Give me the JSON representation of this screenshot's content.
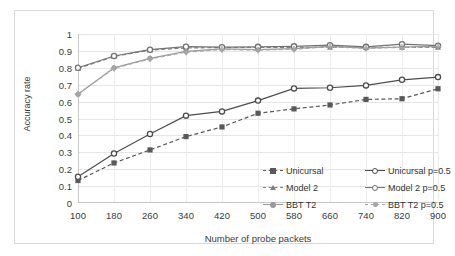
{
  "chart_data": {
    "type": "line",
    "title": "",
    "xlabel": "Number of probe packets",
    "ylabel": "Accuracy rate",
    "x": [
      100,
      180,
      260,
      340,
      420,
      500,
      580,
      660,
      740,
      820,
      900
    ],
    "xticklabels": [
      "100",
      "180",
      "260",
      "340",
      "420",
      "500",
      "580",
      "660",
      "740",
      "820",
      "900"
    ],
    "yticklabels": [
      "0",
      "0.1",
      "0.2",
      "0.3",
      "0.4",
      "0.5",
      "0.6",
      "0.7",
      "0.8",
      "0.9",
      "1"
    ],
    "ylim": [
      0,
      1
    ],
    "ytick_step": 0.1,
    "grid": true,
    "legend_position": "inside-lower-right",
    "series": [
      {
        "name": "Unicursal",
        "marker": "square",
        "dash": "dashed",
        "color": "#595959",
        "values": [
          0.133,
          0.237,
          0.314,
          0.393,
          0.45,
          0.531,
          0.557,
          0.58,
          0.613,
          0.617,
          0.676
        ]
      },
      {
        "name": "Model 2",
        "marker": "triangle",
        "dash": "dashed",
        "color": "#808080",
        "values": [
          0.796,
          0.867,
          0.905,
          0.917,
          0.92,
          0.92,
          0.921,
          0.921,
          0.92,
          0.921,
          0.921
        ]
      },
      {
        "name": "BBT T2",
        "marker": "circle",
        "dash": "solid",
        "color": "#999999",
        "values": [
          0.643,
          0.8,
          0.856,
          0.897,
          0.912,
          0.908,
          0.913,
          0.927,
          0.917,
          0.923,
          0.927
        ]
      },
      {
        "name": "Unicursal p=0.5",
        "marker": "circle-open",
        "dash": "solid",
        "color": "#4d4d4d",
        "values": [
          0.155,
          0.293,
          0.408,
          0.517,
          0.542,
          0.606,
          0.678,
          0.682,
          0.696,
          0.729,
          0.745
        ]
      },
      {
        "name": "Model 2 p=0.5",
        "marker": "circle-open",
        "dash": "solid",
        "color": "#737373",
        "values": [
          0.8,
          0.87,
          0.907,
          0.925,
          0.922,
          0.924,
          0.927,
          0.934,
          0.924,
          0.94,
          0.931
        ]
      },
      {
        "name": "BBT T2 p=0.5",
        "marker": "plus",
        "dash": "dashed",
        "color": "#a6a6a6",
        "values": [
          0.645,
          0.797,
          0.853,
          0.893,
          0.908,
          0.905,
          0.91,
          0.925,
          0.915,
          0.921,
          0.925
        ]
      }
    ]
  },
  "legend": {
    "items": [
      {
        "label": "Unicursal"
      },
      {
        "label": "Unicursal p=0.5"
      },
      {
        "label": "Model 2"
      },
      {
        "label": "Model 2 p=0.5"
      },
      {
        "label": "BBT T2"
      },
      {
        "label": "BBT T2 p=0.5"
      }
    ]
  },
  "colors": {
    "frame_border": "#d9d9d9",
    "grid": "#e6e6e6",
    "axis": "#c9c9c9",
    "text": "#3a3a3a",
    "background": "#ffffff"
  }
}
